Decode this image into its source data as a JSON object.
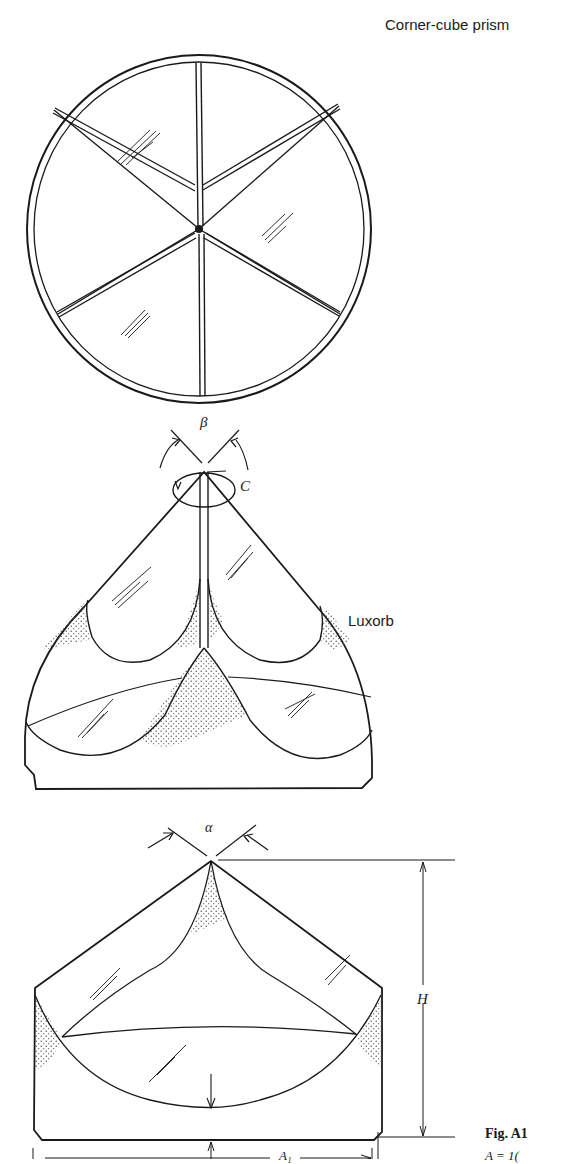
{
  "figure": {
    "title": "Corner-cube prism",
    "caption_label": "Fig. A1",
    "caption_text_fragment": "A = 1(",
    "views": [
      {
        "name": "top-view",
        "description": "circular face divided into six segments"
      },
      {
        "name": "perspective-view",
        "label": "Luxorb",
        "angle_label": "β",
        "rotation_label": "C"
      },
      {
        "name": "side-view",
        "angle_label": "α",
        "height_label": "H",
        "width_label": "A₁"
      }
    ]
  },
  "colors": {
    "line": "#1a1a1a",
    "background": "#ffffff",
    "stipple": "#444444"
  }
}
